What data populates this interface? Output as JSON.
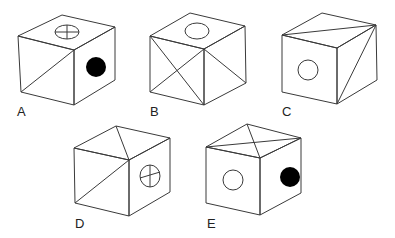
{
  "figure": {
    "options": [
      {
        "label": "A",
        "top": "circle-with-cross",
        "front": "diagonal-line",
        "right": "filled-circle"
      },
      {
        "label": "B",
        "top": "open-circle",
        "front": "x-diagonals",
        "right": "diagonal-line"
      },
      {
        "label": "C",
        "top": "diagonal-line",
        "front": "open-circle",
        "right": "diagonal-line"
      },
      {
        "label": "D",
        "top": "diagonal-line",
        "front": "diagonal-line",
        "right": "circle-with-cross"
      },
      {
        "label": "E",
        "top": "x-diagonals",
        "front": "open-circle",
        "right": "filled-circle"
      }
    ]
  },
  "colors": {
    "line": "#3a3a3a",
    "fill_dark": "#000000",
    "background": "#ffffff"
  }
}
